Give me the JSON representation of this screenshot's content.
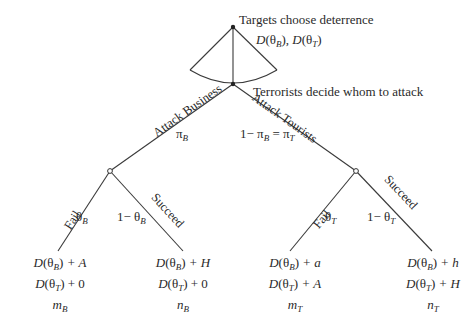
{
  "diagram": {
    "type": "game-tree",
    "nodes": {
      "targets": {
        "label": "Targets choose deterrence",
        "choices": {
          "p1": "D",
          "s1": "(θ",
          "sub1": "B",
          "c1": "), ",
          "p2": "D",
          "s2": "(θ",
          "sub2": "T",
          "c2": ")"
        }
      },
      "terrorists": {
        "label": "Terrorists decide whom to attack"
      }
    },
    "branches": {
      "attack_business": {
        "label": "Attack Business",
        "prob_sym": "π",
        "prob_sub": "B"
      },
      "attack_tourists": {
        "label": "Attack Tourists",
        "prob_prefix": "1− π",
        "prob_sub1": "B",
        "prob_eq": " = π",
        "prob_sub2": "T"
      },
      "business_fail": {
        "label": "Fail",
        "prob_sym": "θ",
        "prob_sub": "B"
      },
      "business_succeed": {
        "label": "Succeed",
        "prob_prefix": "1− θ",
        "prob_sub": "B"
      },
      "tourists_fail": {
        "label": "Fail",
        "prob_sym": "θ",
        "prob_sub": "T"
      },
      "tourists_succeed": {
        "label": "Succeed",
        "prob_prefix": "1− θ",
        "prob_sub": "T"
      }
    },
    "payoffs": [
      {
        "row1": {
          "sub": "B",
          "tail": " + A"
        },
        "row2": {
          "sub": "T",
          "tail": " + 0"
        },
        "outcome": {
          "sym": "m",
          "sub": "B"
        }
      },
      {
        "row1": {
          "sub": "B",
          "tail": " + H"
        },
        "row2": {
          "sub": "T",
          "tail": " + 0"
        },
        "outcome": {
          "sym": "n",
          "sub": "B"
        }
      },
      {
        "row1": {
          "sub": "B",
          "tail": " + a"
        },
        "row2": {
          "sub": "T",
          "tail": " + A"
        },
        "outcome": {
          "sym": "m",
          "sub": "T"
        }
      },
      {
        "row1": {
          "sub": "B",
          "tail": " + h"
        },
        "row2": {
          "sub": "T",
          "tail": " + H"
        },
        "outcome": {
          "sym": "n",
          "sub": "T"
        }
      }
    ],
    "payoff_prefix": {
      "D": "D",
      "open": "(θ",
      "close": ")"
    },
    "colors": {
      "line": "#3a3a3a",
      "text": "#2a2a2a",
      "background": "#ffffff"
    }
  }
}
